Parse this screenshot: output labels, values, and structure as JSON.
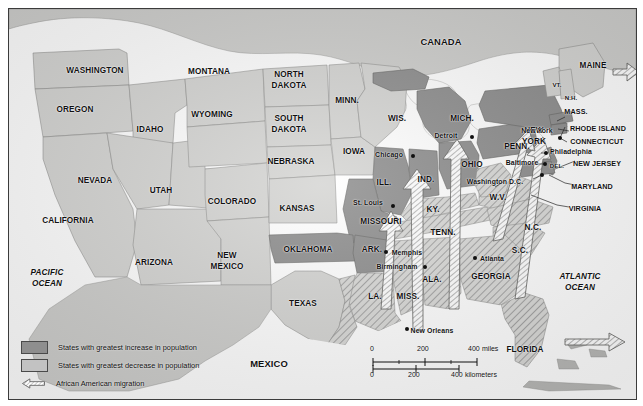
{
  "map": {
    "title": "African American migration map of the United States",
    "countries": [
      {
        "name": "CANADA",
        "x": 432,
        "y": 33
      },
      {
        "name": "MEXICO",
        "x": 260,
        "y": 355
      }
    ],
    "oceans": [
      {
        "name": "PACIFIC",
        "x": 38,
        "y": 264
      },
      {
        "name": "OCEAN",
        "x": 38,
        "y": 274
      },
      {
        "name": "ATLANTIC",
        "x": 571,
        "y": 268
      },
      {
        "name": "OCEAN",
        "x": 571,
        "y": 278
      }
    ],
    "states": [
      {
        "name": "WASHINGTON",
        "x": 86,
        "y": 62
      },
      {
        "name": "MONTANA",
        "x": 200,
        "y": 63
      },
      {
        "name": "NORTH",
        "x": 280,
        "y": 66
      },
      {
        "name": "DAKOTA",
        "x": 280,
        "y": 76
      },
      {
        "name": "MINN.",
        "x": 338,
        "y": 92
      },
      {
        "name": "OREGON",
        "x": 66,
        "y": 101
      },
      {
        "name": "IDAHO",
        "x": 141,
        "y": 121
      },
      {
        "name": "WYOMING",
        "x": 203,
        "y": 106
      },
      {
        "name": "SOUTH",
        "x": 280,
        "y": 110
      },
      {
        "name": "DAKOTA",
        "x": 280,
        "y": 120
      },
      {
        "name": "WIS.",
        "x": 388,
        "y": 110
      },
      {
        "name": "MICH.",
        "x": 453,
        "y": 110
      },
      {
        "name": "IOWA",
        "x": 345,
        "y": 143
      },
      {
        "name": "NEBRASKA",
        "x": 282,
        "y": 153
      },
      {
        "name": "NEVADA",
        "x": 86,
        "y": 172
      },
      {
        "name": "UTAH",
        "x": 152,
        "y": 182
      },
      {
        "name": "COLORADO",
        "x": 223,
        "y": 193
      },
      {
        "name": "KANSAS",
        "x": 288,
        "y": 200
      },
      {
        "name": "ILL.",
        "x": 375,
        "y": 174
      },
      {
        "name": "IND.",
        "x": 417,
        "y": 171
      },
      {
        "name": "OHIO",
        "x": 463,
        "y": 156
      },
      {
        "name": "PENN.",
        "x": 508,
        "y": 138
      },
      {
        "name": "NEW",
        "x": 525,
        "y": 122
      },
      {
        "name": "YORK",
        "x": 525,
        "y": 133
      },
      {
        "name": "CALIFORNIA",
        "x": 59,
        "y": 212
      },
      {
        "name": "ARIZONA",
        "x": 145,
        "y": 254
      },
      {
        "name": "NEW",
        "x": 218,
        "y": 247
      },
      {
        "name": "MEXICO",
        "x": 218,
        "y": 258
      },
      {
        "name": "MISSOURI",
        "x": 372,
        "y": 213
      },
      {
        "name": "OKLAHOMA",
        "x": 299,
        "y": 241
      },
      {
        "name": "ARK.",
        "x": 363,
        "y": 241
      },
      {
        "name": "KY.",
        "x": 424,
        "y": 201
      },
      {
        "name": "TENN.",
        "x": 434,
        "y": 224
      },
      {
        "name": "W.V.",
        "x": 489,
        "y": 189
      },
      {
        "name": "N.C.",
        "x": 524,
        "y": 219
      },
      {
        "name": "S.C.",
        "x": 511,
        "y": 242
      },
      {
        "name": "GEORGIA",
        "x": 482,
        "y": 268
      },
      {
        "name": "ALA.",
        "x": 423,
        "y": 271
      },
      {
        "name": "MISS.",
        "x": 399,
        "y": 288
      },
      {
        "name": "LA.",
        "x": 366,
        "y": 288
      },
      {
        "name": "TEXAS",
        "x": 294,
        "y": 295
      },
      {
        "name": "FLORIDA",
        "x": 516,
        "y": 341
      },
      {
        "name": "MAINE",
        "x": 584,
        "y": 57
      },
      {
        "name": "MASS.",
        "x": 567,
        "y": 103
      },
      {
        "name": "RHODE ISLAND",
        "x": 596,
        "y": 120
      },
      {
        "name": "CONNECTICUT",
        "x": 595,
        "y": 133
      },
      {
        "name": "NEW JERSEY",
        "x": 592,
        "y": 155
      },
      {
        "name": "MARYLAND",
        "x": 587,
        "y": 178
      },
      {
        "name": "VIRGINIA",
        "x": 579,
        "y": 200
      },
      {
        "name": "DEL.",
        "x": 548,
        "y": 156
      }
    ],
    "states_small": [
      {
        "name": "VT.",
        "x": 548,
        "y": 76
      },
      {
        "name": "N.H.",
        "x": 562,
        "y": 89
      }
    ],
    "cities": [
      {
        "name": "Detroit",
        "label_x": 437,
        "label_y": 127,
        "dot_x": 463,
        "dot_y": 128
      },
      {
        "name": "Chicago",
        "label_x": 380,
        "label_y": 146,
        "dot_x": 404,
        "dot_y": 147
      },
      {
        "name": "New York",
        "label_x": 528,
        "label_y": 122,
        "dot_x": 551,
        "dot_y": 129
      },
      {
        "name": "Philadelphia",
        "label_x": 540,
        "label_y": 143,
        "dot_x": 537,
        "dot_y": 144
      },
      {
        "name": "Baltimore",
        "label_x": 513,
        "label_y": 154,
        "dot_x": 536,
        "dot_y": 155
      },
      {
        "name": "Washington D.C.",
        "label_x": 470,
        "label_y": 173,
        "dot_x": 533,
        "dot_y": 166
      },
      {
        "name": "St. Louis",
        "label_x": 359,
        "label_y": 194,
        "dot_x": 384,
        "dot_y": 197
      },
      {
        "name": "Memphis",
        "label_x": 380,
        "label_y": 244,
        "dot_x": 377,
        "dot_y": 243
      },
      {
        "name": "Atlanta",
        "label_x": 470,
        "label_y": 250,
        "dot_x": 466,
        "dot_y": 249
      },
      {
        "name": "Birmingham",
        "label_x": 388,
        "label_y": 258,
        "dot_x": 416,
        "dot_y": 258
      },
      {
        "name": "New Orleans",
        "label_x": 403,
        "label_y": 322,
        "dot_x": 398,
        "dot_y": 320
      }
    ]
  },
  "legend": {
    "items": [
      {
        "icon": "increase-swatch",
        "label": "States with greatest increase in population"
      },
      {
        "icon": "decrease-swatch",
        "label": "States with greatest decrease in population"
      },
      {
        "icon": "migration-arrow-icon",
        "label": "African American migration"
      }
    ]
  },
  "scale": {
    "miles": {
      "ticks": [
        "0",
        "200",
        "400"
      ],
      "unit": "miles"
    },
    "kilometers": {
      "ticks": [
        "0",
        "200",
        "400"
      ],
      "unit": "kilometers"
    }
  },
  "colors": {
    "increase": "#8e8e8e",
    "decrease": "#c2c2c2",
    "land": "#d5d5d3",
    "water": "#ffffff",
    "border": "#3b3b3b",
    "text": "#111111"
  }
}
